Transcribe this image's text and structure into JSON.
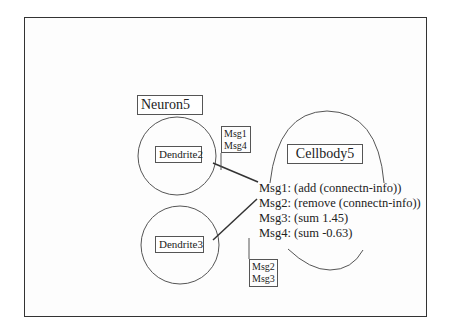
{
  "diagram": {
    "neuron": {
      "label": "Neuron5"
    },
    "dendrites": [
      {
        "label": "Dendrite2"
      },
      {
        "label": "Dendrite3"
      }
    ],
    "cellbody": {
      "label": "Cellbody5"
    },
    "connection_tags": {
      "top": [
        "Msg1",
        "Msg4"
      ],
      "bottom": [
        "Msg2",
        "Msg3"
      ]
    },
    "messages": [
      "Msg1: (add (connectn-info))",
      "Msg2: (remove (connectn-info))",
      "Msg3: (sum 1.45)",
      "Msg4: (sum -0.63)"
    ]
  }
}
